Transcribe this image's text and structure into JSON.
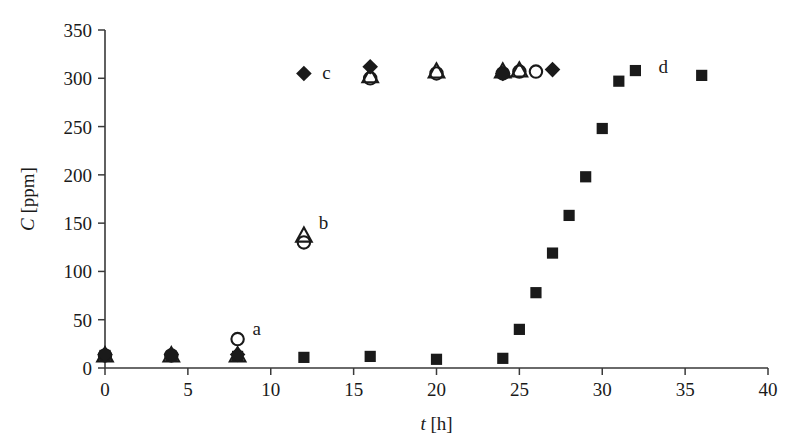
{
  "chart_data": {
    "type": "scatter",
    "title": "",
    "xlabel": "t [h]",
    "ylabel": "C [ppm]",
    "xlim": [
      0,
      40
    ],
    "ylim": [
      0,
      350
    ],
    "xticks": [
      0,
      5,
      10,
      15,
      20,
      25,
      30,
      35,
      40
    ],
    "yticks": [
      0,
      50,
      100,
      150,
      200,
      250,
      300,
      350
    ],
    "grid": false,
    "legend_position": "none",
    "series": [
      {
        "name": "a",
        "marker": "open-circle",
        "points": [
          {
            "x": 0,
            "y": 13
          },
          {
            "x": 4,
            "y": 13
          },
          {
            "x": 8,
            "y": 30
          },
          {
            "x": 12,
            "y": 130
          },
          {
            "x": 16,
            "y": 300
          },
          {
            "x": 20,
            "y": 305
          },
          {
            "x": 24,
            "y": 305
          },
          {
            "x": 25,
            "y": 307
          },
          {
            "x": 26,
            "y": 307
          }
        ]
      },
      {
        "name": "b",
        "marker": "open-triangle",
        "points": [
          {
            "x": 0,
            "y": 13
          },
          {
            "x": 4,
            "y": 13
          },
          {
            "x": 8,
            "y": 13
          },
          {
            "x": 12,
            "y": 137
          },
          {
            "x": 16,
            "y": 302
          },
          {
            "x": 20,
            "y": 307
          },
          {
            "x": 24,
            "y": 307
          },
          {
            "x": 25,
            "y": 308
          }
        ]
      },
      {
        "name": "c",
        "marker": "filled-diamond",
        "points": [
          {
            "x": 0,
            "y": 14
          },
          {
            "x": 4,
            "y": 14
          },
          {
            "x": 8,
            "y": 14
          },
          {
            "x": 12,
            "y": 305
          },
          {
            "x": 16,
            "y": 312
          },
          {
            "x": 24,
            "y": 305
          },
          {
            "x": 27,
            "y": 309
          }
        ]
      },
      {
        "name": "d",
        "marker": "filled-square",
        "points": [
          {
            "x": 0,
            "y": 13
          },
          {
            "x": 4,
            "y": 12
          },
          {
            "x": 8,
            "y": 12
          },
          {
            "x": 12,
            "y": 11
          },
          {
            "x": 16,
            "y": 12
          },
          {
            "x": 20,
            "y": 9
          },
          {
            "x": 24,
            "y": 10
          },
          {
            "x": 25,
            "y": 40
          },
          {
            "x": 26,
            "y": 78
          },
          {
            "x": 27,
            "y": 119
          },
          {
            "x": 28,
            "y": 158
          },
          {
            "x": 29,
            "y": 198
          },
          {
            "x": 30,
            "y": 248
          },
          {
            "x": 31,
            "y": 297
          },
          {
            "x": 32,
            "y": 308
          },
          {
            "x": 36,
            "y": 303
          }
        ]
      }
    ],
    "annotations": [
      {
        "text": "a",
        "x": 8.9,
        "y": 40
      },
      {
        "text": "b",
        "x": 12.9,
        "y": 150
      },
      {
        "text": "c",
        "x": 13.1,
        "y": 305
      },
      {
        "text": "d",
        "x": 33.4,
        "y": 312
      }
    ],
    "colors": {
      "marker": "#1a1a1a",
      "axis": "#3a3a3a",
      "background": "#ffffff"
    }
  }
}
